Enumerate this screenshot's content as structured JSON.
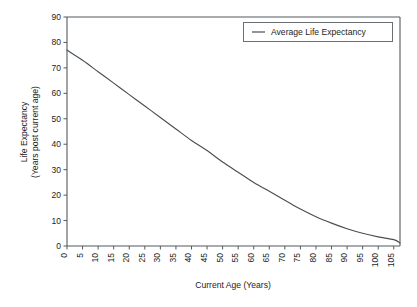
{
  "chart_data": {
    "type": "line",
    "title": "",
    "xlabel": "Current Age (Years)",
    "ylabel_line1": "Life Expectancy",
    "ylabel_line2": "(Years post current age)",
    "xlim": [
      0,
      107
    ],
    "ylim": [
      0,
      90
    ],
    "xticks": [
      0,
      5,
      10,
      15,
      20,
      25,
      30,
      35,
      40,
      45,
      50,
      55,
      60,
      65,
      70,
      75,
      80,
      85,
      90,
      95,
      100,
      105
    ],
    "yticks": [
      0,
      10,
      20,
      30,
      40,
      50,
      60,
      70,
      80,
      90
    ],
    "xtick_labels": [
      "0",
      "5",
      "10",
      "15",
      "20",
      "25",
      "30",
      "35",
      "40",
      "45",
      "50",
      "55",
      "60",
      "65",
      "70",
      "75",
      "80",
      "85",
      "90",
      "95",
      "100",
      "105"
    ],
    "ytick_labels": [
      "0",
      "10",
      "20",
      "30",
      "40",
      "50",
      "60",
      "70",
      "80",
      "90"
    ],
    "xtick_rotation": 90,
    "grid": false,
    "legend_position": "top-right",
    "legend_entries": [
      "Average Life Expectancy"
    ],
    "series": [
      {
        "name": "Average Life Expectancy",
        "color": "#4a4f53",
        "x": [
          0,
          5,
          10,
          15,
          20,
          25,
          30,
          35,
          40,
          45,
          50,
          55,
          60,
          65,
          70,
          75,
          80,
          85,
          90,
          95,
          100,
          105,
          107
        ],
        "values": [
          77.0,
          73.0,
          68.5,
          64.0,
          59.5,
          55.0,
          50.5,
          46.0,
          41.5,
          37.5,
          33.0,
          29.0,
          25.0,
          21.5,
          18.0,
          14.5,
          11.5,
          9.0,
          6.8,
          5.0,
          3.6,
          2.5,
          1.2
        ]
      }
    ]
  },
  "figure": {
    "background_color": "#ffffff",
    "axis_color": "#555a5e"
  }
}
